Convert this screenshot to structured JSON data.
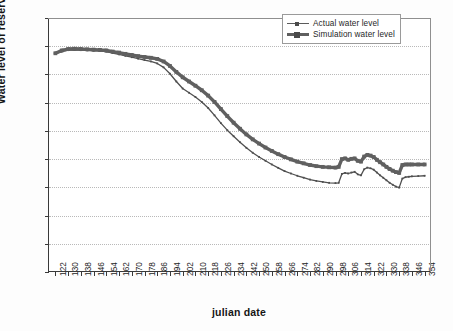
{
  "chart_data": {
    "type": "line",
    "title": "",
    "xlabel": "julian date",
    "ylabel": "Water level of reservial (m)",
    "xlim": [
      118,
      358
    ],
    "ylim": [
      192,
      210
    ],
    "ytick_step": 2,
    "xtick_step": 8,
    "grid": "horizontal-dotted",
    "legend_position": "top-right",
    "yticks": [
      192,
      194,
      196,
      198,
      200,
      202,
      204,
      206,
      208,
      210
    ],
    "xticks": [
      122,
      130,
      138,
      146,
      154,
      162,
      170,
      178,
      186,
      194,
      202,
      210,
      218,
      226,
      234,
      242,
      250,
      258,
      266,
      274,
      282,
      290,
      298,
      306,
      314,
      322,
      330,
      338,
      346,
      354
    ],
    "series": [
      {
        "name": "Actual water level",
        "color": "#4f4f4f",
        "style": "thin-line-small-marker",
        "x": [
          122,
          126,
          130,
          134,
          138,
          142,
          146,
          150,
          154,
          158,
          162,
          166,
          170,
          174,
          178,
          182,
          186,
          190,
          194,
          198,
          202,
          206,
          210,
          214,
          218,
          222,
          226,
          230,
          234,
          238,
          242,
          246,
          250,
          254,
          258,
          262,
          266,
          270,
          274,
          278,
          282,
          286,
          290,
          294,
          298,
          300,
          302,
          304,
          306,
          308,
          310,
          312,
          314,
          316,
          318,
          320,
          322,
          324,
          326,
          328,
          330,
          332,
          334,
          336,
          338,
          340,
          342,
          344,
          346,
          350,
          354
        ],
        "y": [
          207.45,
          207.62,
          207.72,
          207.74,
          207.72,
          207.7,
          207.68,
          207.66,
          207.62,
          207.52,
          207.42,
          207.32,
          207.22,
          207.12,
          207.02,
          206.92,
          206.78,
          206.5,
          206.05,
          205.5,
          205.0,
          204.7,
          204.4,
          204.05,
          203.62,
          203.1,
          202.55,
          202.05,
          201.62,
          201.2,
          200.8,
          200.45,
          200.15,
          199.88,
          199.62,
          199.38,
          199.15,
          198.98,
          198.82,
          198.68,
          198.55,
          198.45,
          198.38,
          198.32,
          198.3,
          198.32,
          198.95,
          199.02,
          198.98,
          199.05,
          199.1,
          198.92,
          198.85,
          199.28,
          199.4,
          199.35,
          199.25,
          199.05,
          198.85,
          198.68,
          198.5,
          198.32,
          198.18,
          198.05,
          197.98,
          198.62,
          198.72,
          198.75,
          198.78,
          198.8,
          198.82
        ]
      },
      {
        "name": "Simulation water level",
        "color": "#606060",
        "style": "thick-line-square-marker",
        "x": [
          122,
          126,
          130,
          134,
          138,
          142,
          146,
          150,
          154,
          158,
          162,
          166,
          170,
          174,
          178,
          182,
          186,
          190,
          194,
          198,
          202,
          206,
          210,
          214,
          218,
          222,
          226,
          230,
          234,
          238,
          242,
          246,
          250,
          254,
          258,
          262,
          266,
          270,
          274,
          278,
          282,
          286,
          290,
          294,
          298,
          300,
          302,
          304,
          306,
          308,
          310,
          312,
          314,
          316,
          318,
          320,
          322,
          324,
          326,
          328,
          330,
          332,
          334,
          336,
          338,
          340,
          342,
          344,
          346,
          350,
          354
        ],
        "y": [
          207.5,
          207.7,
          207.8,
          207.82,
          207.8,
          207.78,
          207.76,
          207.74,
          207.7,
          207.62,
          207.55,
          207.46,
          207.38,
          207.3,
          207.24,
          207.18,
          207.1,
          206.92,
          206.6,
          206.18,
          205.8,
          205.5,
          205.2,
          204.88,
          204.5,
          204.05,
          203.55,
          203.05,
          202.58,
          202.15,
          201.75,
          201.4,
          201.1,
          200.82,
          200.58,
          200.35,
          200.15,
          199.98,
          199.82,
          199.7,
          199.58,
          199.5,
          199.45,
          199.42,
          199.4,
          199.45,
          200.0,
          200.05,
          199.95,
          200.02,
          200.05,
          199.88,
          199.82,
          200.18,
          200.3,
          200.25,
          200.15,
          199.95,
          199.78,
          199.62,
          199.45,
          199.3,
          199.18,
          199.08,
          199.02,
          199.58,
          199.62,
          199.62,
          199.62,
          199.62,
          199.62
        ]
      }
    ]
  },
  "legend": {
    "items": [
      {
        "label": "Actual water level"
      },
      {
        "label": "Simulation water level"
      }
    ]
  }
}
